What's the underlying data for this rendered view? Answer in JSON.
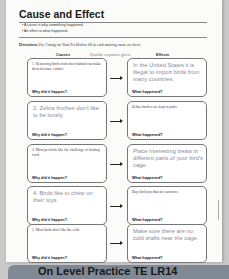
{
  "title": "Cause and Effect",
  "bullets": [
    "A cause is why something happened.",
    "An effect is what happened."
  ],
  "directions": {
    "label": "Directions",
    "text": "Use Caring for Your Pet Bird to fill in each missing cause or effect."
  },
  "columns": {
    "causes": "Causes",
    "note": "Possible responses given.",
    "effects": "Effects"
  },
  "rows": [
    {
      "cause": "1.  Removing birds from their habitat can make them become extinct.",
      "cause_hand": false,
      "cause_q": "Why did it happen?",
      "effect": "In the United States it is illegal to import birds from many countries.",
      "effect_hand": true,
      "effect_q": "What happened?"
    },
    {
      "cause": "2. Zebra finches don't like to be lonely.",
      "cause_hand": true,
      "cause_q": "Why did it happen?",
      "effect": "Zebra finches are kept in pairs.",
      "effect_hand": false,
      "effect_q": "What happened?"
    },
    {
      "cause": "3.  Most pet birds like the challenge of finding food.",
      "cause_hand": false,
      "cause_q": "Why did it happen?",
      "effect": "Place interesting treats in different parts of your bird's cage.",
      "effect_hand": true,
      "effect_q": "What happened?"
    },
    {
      "cause": "4. Birds like to chew on their toys.",
      "cause_hand": true,
      "cause_q": "Why did it happen?",
      "effect": "Buy bird toys that are nontoxic.",
      "effect_hand": false,
      "effect_q": "What happened?"
    },
    {
      "cause": "5.  Most birds don't like the cold.",
      "cause_hand": false,
      "cause_q": "Why did it happen?",
      "effect": "Make sure there are no cold drafts near the cage.",
      "effect_hand": true,
      "effect_q": "What happened?"
    }
  ],
  "footer": "On Level Practice TE  LR14"
}
